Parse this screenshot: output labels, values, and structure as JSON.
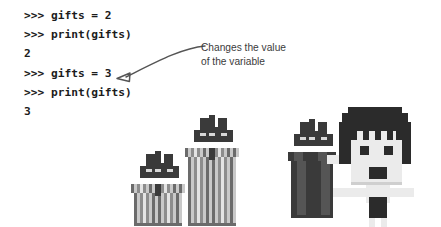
{
  "code": {
    "lines": [
      {
        "id": "line-1",
        "text": ">>> gifts = 2",
        "kind": "prompt"
      },
      {
        "id": "line-2",
        "text": ">>> print(gifts)",
        "kind": "prompt"
      },
      {
        "id": "line-3",
        "text": "2",
        "kind": "output"
      },
      {
        "id": "line-4",
        "text": ">>> gifts = 3",
        "kind": "prompt"
      },
      {
        "id": "line-5",
        "text": ">>> print(gifts)",
        "kind": "prompt"
      },
      {
        "id": "line-6",
        "text": "3",
        "kind": "output"
      }
    ]
  },
  "annotation": {
    "line1": "Changes the value",
    "line2": "of the variable",
    "arrow_color": "#555555",
    "points_to_line": ">>> gifts = 3"
  },
  "illustration": {
    "gift_boxes": {
      "label": "two striped gift boxes with bows",
      "count": 2,
      "colors": {
        "dark": "#6b6b6b",
        "mid": "#8d8d8d",
        "light": "#c9c9c9",
        "bright": "#e4e4e4",
        "bow": "#3a3a3a",
        "bow_light": "#d8d8d8"
      }
    },
    "character": {
      "label": "pixel character holding a dark gift box",
      "expression": "surprised",
      "colors": {
        "hair": "#2b2b2b",
        "skin": "#ebebeb",
        "shade": "#cfcfcf",
        "gift_dark": "#3a3a3a",
        "gift_mid": "#555555",
        "gift_light": "#d8d8d8"
      }
    }
  },
  "theme": {
    "background": "#ffffff",
    "code_color": "#1c1c1c",
    "annotation_color": "#3b3b3b"
  }
}
